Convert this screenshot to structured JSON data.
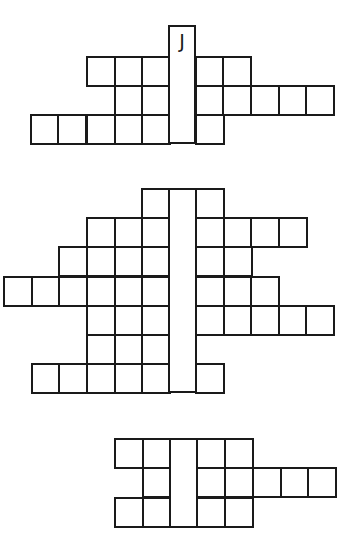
{
  "puzzles": [
    {
      "id": "puzzle-1",
      "column": {
        "x": 168,
        "y": 25,
        "w": 28,
        "h": 119,
        "letter": "J"
      },
      "cells": [
        [
          86,
          56
        ],
        [
          114,
          56
        ],
        [
          141,
          56
        ],
        [
          195,
          56
        ],
        [
          222,
          56
        ],
        [
          114,
          85
        ],
        [
          141,
          85
        ],
        [
          195,
          85
        ],
        [
          222,
          85
        ],
        [
          250,
          85
        ],
        [
          278,
          85
        ],
        [
          305,
          85
        ],
        [
          30,
          114
        ],
        [
          57,
          114
        ],
        [
          86,
          114
        ],
        [
          114,
          114
        ],
        [
          141,
          114
        ],
        [
          195,
          114
        ]
      ]
    },
    {
      "id": "puzzle-2",
      "column": {
        "x": 168,
        "y": 188,
        "w": 29,
        "h": 205,
        "letter": ""
      },
      "cells": [
        [
          141,
          188
        ],
        [
          195,
          188
        ],
        [
          86,
          217
        ],
        [
          114,
          217
        ],
        [
          141,
          217
        ],
        [
          195,
          217
        ],
        [
          223,
          217
        ],
        [
          250,
          217
        ],
        [
          278,
          217
        ],
        [
          58,
          246
        ],
        [
          86,
          246
        ],
        [
          114,
          246
        ],
        [
          141,
          246
        ],
        [
          195,
          246
        ],
        [
          223,
          246
        ],
        [
          3,
          276
        ],
        [
          31,
          276
        ],
        [
          58,
          276
        ],
        [
          86,
          276
        ],
        [
          114,
          276
        ],
        [
          141,
          276
        ],
        [
          195,
          276
        ],
        [
          223,
          276
        ],
        [
          250,
          276
        ],
        [
          86,
          305
        ],
        [
          114,
          305
        ],
        [
          141,
          305
        ],
        [
          195,
          305
        ],
        [
          223,
          305
        ],
        [
          250,
          305
        ],
        [
          278,
          305
        ],
        [
          305,
          305
        ],
        [
          86,
          334
        ],
        [
          114,
          334
        ],
        [
          141,
          334
        ],
        [
          31,
          363
        ],
        [
          58,
          363
        ],
        [
          86,
          363
        ],
        [
          114,
          363
        ],
        [
          141,
          363
        ],
        [
          195,
          363
        ]
      ]
    },
    {
      "id": "puzzle-3",
      "column": {
        "x": 169,
        "y": 438,
        "w": 29,
        "h": 90,
        "letter": ""
      },
      "cells": [
        [
          114,
          438
        ],
        [
          142,
          438
        ],
        [
          196,
          438
        ],
        [
          224,
          438
        ],
        [
          142,
          467
        ],
        [
          196,
          467
        ],
        [
          224,
          467
        ],
        [
          252,
          467
        ],
        [
          280,
          467
        ],
        [
          307,
          467
        ],
        [
          114,
          497
        ],
        [
          142,
          497
        ],
        [
          196,
          497
        ],
        [
          224,
          497
        ]
      ]
    }
  ]
}
